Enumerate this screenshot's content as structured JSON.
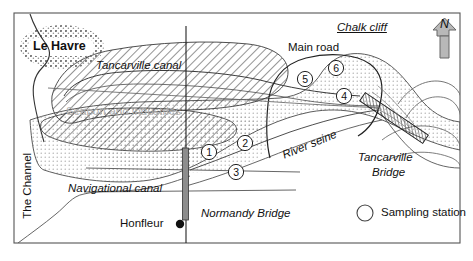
{
  "figure": {
    "type": "map",
    "region": "Seine estuary, Normandy, France"
  },
  "labels": {
    "le_havre": "Le Havre",
    "tancarville_canal": "Tancarville canal",
    "seaport_and_industries": "Seaport and industries",
    "the_channel": "The Channel",
    "navigational_canal": "Navigational canal",
    "honfleur": "Honfleur",
    "normandy_bridge": "Normandy Bridge",
    "river_seine": "River seine",
    "main_road": "Main road",
    "chalk_cliff": "Chalk cliff",
    "tancarville_bridge_line1": "Tancarville",
    "tancarville_bridge_line2": "Bridge",
    "north_indicator": "N"
  },
  "legend": {
    "symbol": "open-circle",
    "label": "Sampling station"
  },
  "sampling_stations": [
    {
      "id": "1",
      "label": "1",
      "x": 209,
      "y": 152
    },
    {
      "id": "2",
      "label": "2",
      "x": 245,
      "y": 143
    },
    {
      "id": "3",
      "label": "3",
      "x": 236,
      "y": 172
    },
    {
      "id": "4",
      "label": "4",
      "x": 344,
      "y": 96
    },
    {
      "id": "5",
      "label": "5",
      "x": 305,
      "y": 79
    },
    {
      "id": "6",
      "label": "6",
      "x": 336,
      "y": 68
    }
  ],
  "point_features": [
    {
      "name": "honfleur-dot",
      "kind": "filled-dot",
      "x": 180,
      "y": 224
    }
  ],
  "colors": {
    "ink": "#111111",
    "frame": "#555555",
    "hatch": "#444444",
    "dotted_fill": "#8a8a8a",
    "seaport_text": "#b0b0b0",
    "urban_speckle": "#808080",
    "arrow_fill": "#b8b8b8",
    "bridge_pylon": "#8d8d8d"
  },
  "areas": {
    "hatched": "Seaport and industries (diagonal hatch)",
    "dotted": "Seine estuary water (stipple dots)",
    "speckled": "Le Havre urban area"
  }
}
